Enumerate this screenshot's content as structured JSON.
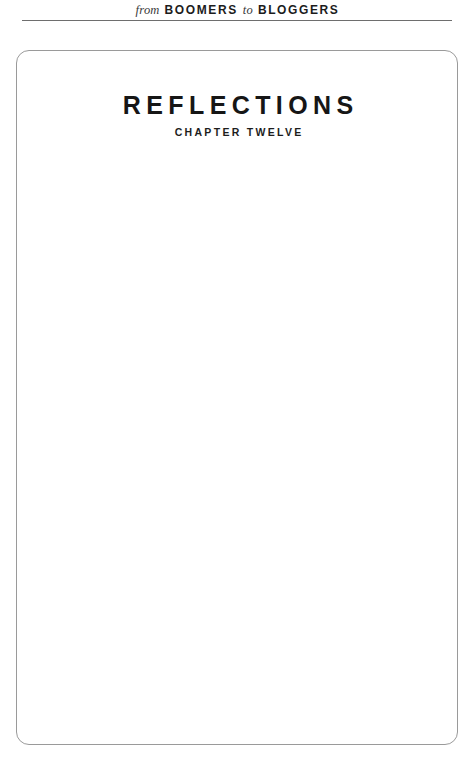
{
  "running_header": {
    "word_from": "from",
    "book_first": "BOOMERS",
    "word_to": "to",
    "book_second": "BLOGGERS"
  },
  "page": {
    "title": "REFLECTIONS",
    "subtitle": "CHAPTER TWELVE",
    "body_text": ""
  },
  "colors": {
    "title_ink": "#161616",
    "rule": "#6e6e6e",
    "frame_border": "#9a9a9a",
    "paper": "#ffffff"
  }
}
